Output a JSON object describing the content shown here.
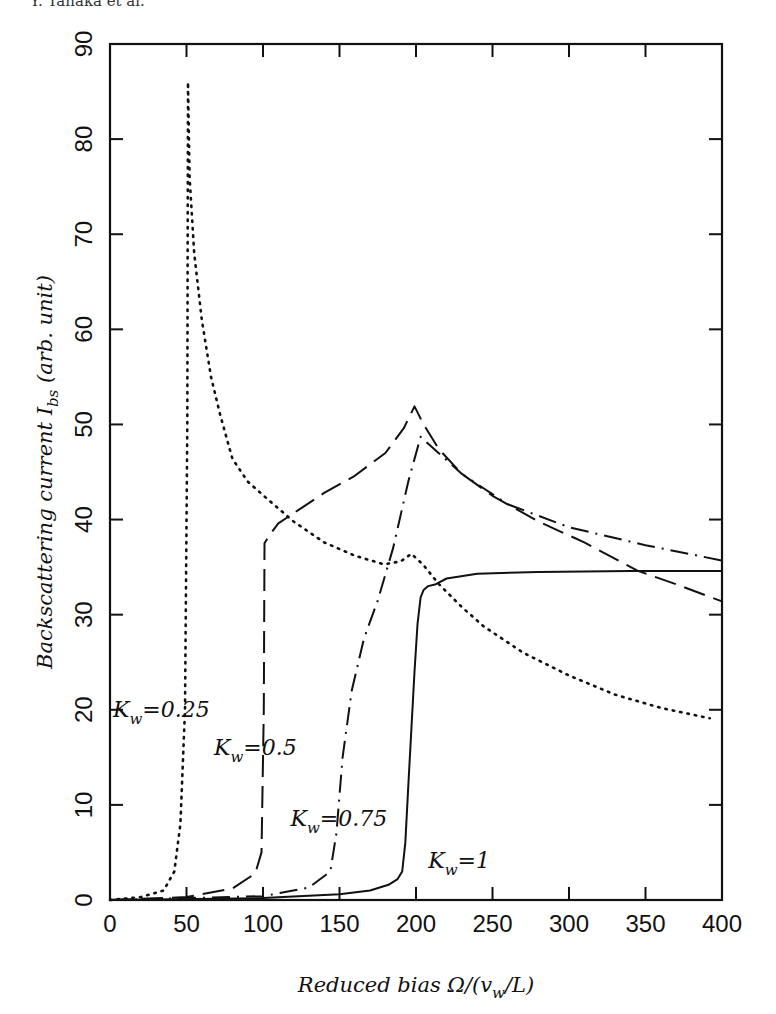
{
  "header": {
    "text": "Y. Tanaka et al."
  },
  "chart_data": {
    "type": "line",
    "title": "",
    "xlabel": "Reduced bias Ω/(v_w/L)",
    "ylabel": "Backscattering current I_bs (arb. unit)",
    "xlim": [
      0,
      400
    ],
    "ylim": [
      0,
      90
    ],
    "xticks": [
      0,
      50,
      100,
      150,
      200,
      250,
      300,
      350,
      400
    ],
    "yticks": [
      0,
      10,
      20,
      30,
      40,
      50,
      60,
      70,
      80,
      90
    ],
    "grid": false,
    "legend": "inline annotations",
    "series": [
      {
        "name": "K_w=0.25",
        "style": "dotted",
        "x": [
          0,
          20,
          35,
          42,
          46,
          49,
          50.5,
          51,
          52,
          55,
          60,
          66,
          72,
          80,
          90,
          104,
          120,
          140,
          160,
          179,
          190,
          197,
          205,
          215,
          230,
          244,
          270,
          300,
          330,
          360,
          392
        ],
        "y": [
          0,
          0.3,
          1.0,
          3.0,
          8.0,
          20.0,
          50.0,
          86.0,
          76.0,
          68.0,
          61.0,
          55.0,
          51.0,
          46.4,
          44.0,
          42.0,
          39.8,
          37.6,
          36.2,
          35.3,
          35.6,
          36.4,
          35.2,
          33.2,
          30.8,
          28.8,
          26.0,
          23.6,
          21.6,
          20.2,
          19.1
        ]
      },
      {
        "name": "K_w=0.5",
        "style": "dashed",
        "x": [
          0,
          50,
          80,
          95,
          99,
          100.5,
          101,
          104,
          110,
          125,
          140,
          160,
          180,
          192,
          199,
          205,
          215,
          230,
          250,
          280,
          310,
          345,
          370,
          400
        ],
        "y": [
          0,
          0.3,
          1.2,
          2.8,
          5.0,
          20.0,
          37.5,
          38.3,
          39.6,
          41.2,
          42.8,
          44.6,
          47.0,
          49.6,
          51.9,
          50.0,
          47.4,
          44.8,
          42.5,
          39.8,
          37.6,
          34.6,
          33.2,
          31.4
        ]
      },
      {
        "name": "K_w=0.75",
        "style": "dash-dot",
        "x": [
          0,
          100,
          130,
          144,
          148,
          152,
          158,
          166,
          175,
          185,
          195,
          203,
          212,
          230,
          260,
          300,
          350,
          400
        ],
        "y": [
          0,
          0.4,
          1.3,
          3.0,
          7.0,
          15.0,
          22.0,
          27.5,
          31.5,
          37.0,
          44.0,
          48.7,
          47.4,
          44.8,
          41.6,
          39.2,
          37.3,
          35.7
        ]
      },
      {
        "name": "K_w=1",
        "style": "solid",
        "x": [
          0,
          100,
          150,
          170,
          182,
          188,
          191,
          193,
          195,
          197,
          199,
          201,
          203,
          205,
          208,
          213,
          220,
          240,
          280,
          340,
          400
        ],
        "y": [
          0,
          0.2,
          0.6,
          1.0,
          1.6,
          2.2,
          3.0,
          6.0,
          12.0,
          18.0,
          24.0,
          29.0,
          31.8,
          32.6,
          33.0,
          33.2,
          33.8,
          34.3,
          34.5,
          34.6,
          34.6
        ]
      }
    ],
    "annotations": [
      {
        "text": "K_w=0.25",
        "x": 2,
        "y": 19.2
      },
      {
        "text": "K_w=0.5",
        "x": 68,
        "y": 15.2
      },
      {
        "text": "K_w=0.75",
        "x": 118,
        "y": 7.8
      },
      {
        "text": "K_w=1",
        "x": 208,
        "y": 3.4
      }
    ]
  },
  "labels": {
    "xlabel_main": "Reduced bias Ω/(",
    "xlabel_v": "v",
    "xlabel_w": "w",
    "xlabel_tail": "/L)",
    "ylabel_main": "Backscattering current ",
    "ylabel_I": "I",
    "ylabel_bs": "bs",
    "ylabel_tail": " (arb. unit)"
  }
}
